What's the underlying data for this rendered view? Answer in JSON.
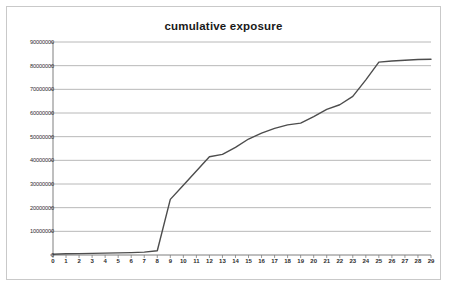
{
  "chart_data": {
    "type": "line",
    "title": "cumulative exposure",
    "xlabel": "",
    "ylabel": "",
    "xlim": [
      0,
      29
    ],
    "ylim": [
      0,
      90000000
    ],
    "grid": true,
    "legend": "none",
    "y_tick_labels": [
      "0",
      "10000000",
      "20000000",
      "30000000",
      "40000000",
      "50000000",
      "60000000",
      "70000000",
      "80000000",
      "90000000"
    ],
    "y_tick_values": [
      0,
      10000000,
      20000000,
      30000000,
      40000000,
      50000000,
      60000000,
      70000000,
      80000000,
      90000000
    ],
    "x_tick_labels": [
      "0",
      "1",
      "2",
      "3",
      "4",
      "5",
      "6",
      "7",
      "8",
      "9",
      "10",
      "11",
      "12",
      "13",
      "14",
      "15",
      "16",
      "17",
      "18",
      "19",
      "20",
      "21",
      "22",
      "23",
      "24",
      "25",
      "26",
      "27",
      "28",
      "29"
    ],
    "categories": [
      0,
      1,
      2,
      3,
      4,
      5,
      6,
      7,
      8,
      9,
      10,
      11,
      12,
      13,
      14,
      15,
      16,
      17,
      18,
      19,
      20,
      21,
      22,
      23,
      24,
      25,
      26,
      27,
      28,
      29
    ],
    "values": [
      300000,
      500000,
      600000,
      700000,
      800000,
      900000,
      1000000,
      1200000,
      1800000,
      23500000,
      29500000,
      35500000,
      41500000,
      42500000,
      45500000,
      49000000,
      51500000,
      53500000,
      55000000,
      55700000,
      58500000,
      61500000,
      63500000,
      67000000,
      74000000,
      81500000,
      82000000,
      82300000,
      82600000,
      82700000
    ],
    "series": [
      {
        "name": "cumulative exposure",
        "color": "#4d4d4d",
        "values": [
          300000,
          500000,
          600000,
          700000,
          800000,
          900000,
          1000000,
          1200000,
          1800000,
          23500000,
          29500000,
          35500000,
          41500000,
          42500000,
          45500000,
          49000000,
          51500000,
          53500000,
          55000000,
          55700000,
          58500000,
          61500000,
          63500000,
          67000000,
          74000000,
          81500000,
          82000000,
          82300000,
          82600000,
          82700000
        ]
      }
    ],
    "colors": {
      "line": "#4d4d4d",
      "gridline": "#a6a6a6",
      "axis": "#7f7f7f",
      "border": "#c9c9c9",
      "background": "#ffffff",
      "text": "#2b2b2b"
    }
  }
}
